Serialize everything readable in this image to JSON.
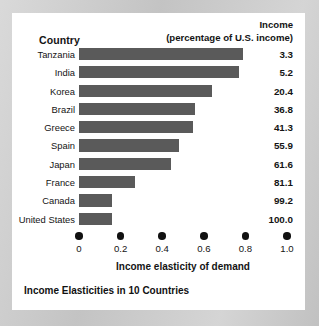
{
  "card": {
    "background": "#ffffff",
    "page_background": "#c9c9c9"
  },
  "header": {
    "country_label": "Country",
    "income_line1": "Income",
    "income_line2": "(percentage of U.S. income)"
  },
  "caption": "Income Elasticities in 10 Countries",
  "axis": {
    "title": "Income elasticity of demand",
    "tick_labels": [
      "0",
      "0.2",
      "0.4",
      "0.6",
      "0.8",
      "1.0"
    ]
  },
  "chart_data": {
    "type": "bar",
    "orientation": "horizontal",
    "title": "Income Elasticities in 10 Countries",
    "xlabel": "Income elasticity of demand",
    "ylabel": "Country",
    "xlim": [
      0,
      1.0
    ],
    "xticks": [
      0,
      0.2,
      0.4,
      0.6,
      0.8,
      1.0
    ],
    "grid": false,
    "legend": "none",
    "bar_color": "#5a5a5a",
    "categories": [
      "Tanzania",
      "India",
      "Korea",
      "Brazil",
      "Greece",
      "Spain",
      "Japan",
      "France",
      "Canada",
      "United States"
    ],
    "values": [
      0.79,
      0.77,
      0.64,
      0.56,
      0.55,
      0.48,
      0.44,
      0.27,
      0.16,
      0.16
    ],
    "annotation_column": {
      "name": "Income (percentage of U.S. income)",
      "values": [
        "3.3",
        "5.2",
        "20.4",
        "36.8",
        "41.3",
        "55.9",
        "61.6",
        "81.1",
        "99.2",
        "100.0"
      ]
    },
    "rows": [
      {
        "country": "Tanzania",
        "elasticity": 0.79,
        "income_pct": "3.3"
      },
      {
        "country": "India",
        "elasticity": 0.77,
        "income_pct": "5.2"
      },
      {
        "country": "Korea",
        "elasticity": 0.64,
        "income_pct": "20.4"
      },
      {
        "country": "Brazil",
        "elasticity": 0.56,
        "income_pct": "36.8"
      },
      {
        "country": "Greece",
        "elasticity": 0.55,
        "income_pct": "41.3"
      },
      {
        "country": "Spain",
        "elasticity": 0.48,
        "income_pct": "55.9"
      },
      {
        "country": "Japan",
        "elasticity": 0.44,
        "income_pct": "61.6"
      },
      {
        "country": "France",
        "elasticity": 0.27,
        "income_pct": "81.1"
      },
      {
        "country": "Canada",
        "elasticity": 0.16,
        "income_pct": "99.2"
      },
      {
        "country": "United States",
        "elasticity": 0.16,
        "income_pct": "100.0"
      }
    ]
  }
}
